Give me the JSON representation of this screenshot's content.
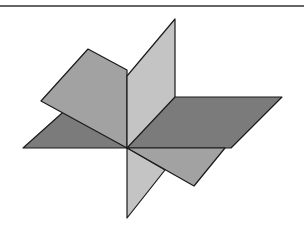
{
  "figure": {
    "colors": {
      "horizontal_plane": "#7b7b7b",
      "tilted_plane": "#a2a2a2",
      "vertical_plane": "#c4c4c4",
      "edge": "#1a1a1a",
      "rule": "#666666"
    }
  }
}
